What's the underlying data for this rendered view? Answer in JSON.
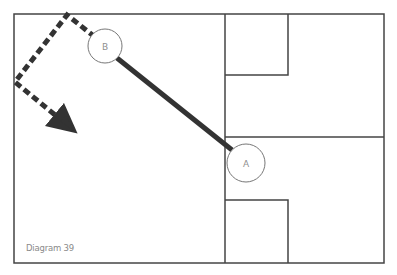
{
  "diagram": {
    "caption": "Diagram 39",
    "colors": {
      "frame": "#444444",
      "path": "#333333",
      "circle_stroke": "#777777",
      "label": "#909090"
    },
    "points": [
      {
        "label": "B",
        "cx": 105,
        "cy": 46,
        "r": 17
      },
      {
        "label": "A",
        "cx": 246,
        "cy": 163,
        "r": 19
      }
    ],
    "solid_line": {
      "from": "A",
      "to": "B"
    },
    "dashed_path": {
      "description": "dashed route from B to top edge, down-left to left wall, then arrow heading down-right",
      "points": [
        [
          95,
          37
        ],
        [
          67,
          15
        ],
        [
          15,
          82
        ],
        [
          70,
          127
        ]
      ],
      "arrow": true
    },
    "layout": {
      "outer": {
        "x": 14,
        "y": 14,
        "w": 370,
        "h": 249
      },
      "vertical_divider_x": 225,
      "horizontal_divider_y": 137,
      "top_box": {
        "x": 225,
        "y": 14,
        "w": 63,
        "h": 61
      },
      "bottom_box": {
        "x": 225,
        "y": 200,
        "w": 63,
        "h": 63
      }
    }
  }
}
